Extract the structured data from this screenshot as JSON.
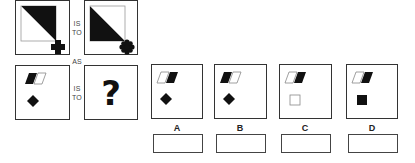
{
  "question": {
    "connectors": {
      "is": "IS",
      "to": "TO",
      "as": "AS"
    },
    "unknown_symbol": "?",
    "top_pair": [
      {
        "shape": "square-diagonal-top-right-filled",
        "corner_icon": "cross-icon"
      },
      {
        "shape": "square-diagonal-bottom-left-filled",
        "corner_icon": "flower-icon"
      }
    ],
    "bottom_left": {
      "parallelograms": [
        "filled",
        "outline"
      ],
      "lower_shape": "diamond-filled"
    }
  },
  "options": [
    {
      "letter": "A",
      "parallelograms": [
        "outline",
        "filled"
      ],
      "lower_shape": "diamond-filled"
    },
    {
      "letter": "B",
      "parallelograms": [
        "filled",
        "outline"
      ],
      "lower_shape": "diamond-filled"
    },
    {
      "letter": "C",
      "parallelograms": [
        "outline",
        "filled"
      ],
      "lower_shape": "square-outline"
    },
    {
      "letter": "D",
      "parallelograms": [
        "outline",
        "filled"
      ],
      "lower_shape": "square-filled"
    }
  ]
}
